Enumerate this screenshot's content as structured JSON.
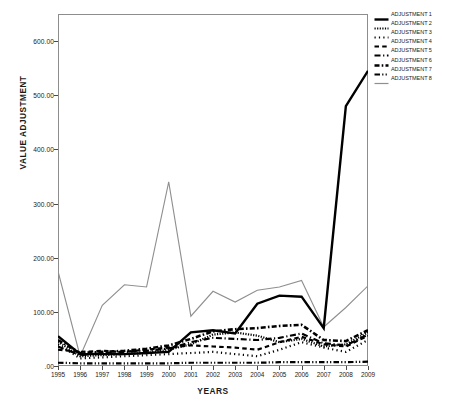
{
  "chart_data": {
    "type": "line",
    "title": "",
    "xlabel": "YEARS",
    "ylabel": "VALUE ADJUSTMENT",
    "x": [
      1995,
      1996,
      1997,
      1998,
      1999,
      2000,
      2001,
      2002,
      2003,
      2004,
      2005,
      2006,
      2007,
      2008,
      2009
    ],
    "categories": [
      "1995",
      "1996",
      "1997",
      "1998",
      "1999",
      "2000",
      "2001",
      "2002",
      "2003",
      "2004",
      "2005",
      "2006",
      "2007",
      "2008",
      "2009"
    ],
    "ylim": [
      0,
      650
    ],
    "xlim": [
      1995,
      2009
    ],
    "yticks": [
      0,
      100,
      200,
      300,
      400,
      500,
      600
    ],
    "ytick_labels": [
      ".00",
      "100.00",
      "200.00",
      "300.00",
      "400.00",
      "500.00",
      "600.00"
    ],
    "grid": false,
    "legend_position": "right",
    "series": [
      {
        "name": "ADJUSTMENT 1",
        "style": "solid-bold",
        "color": "#000000",
        "values": [
          55,
          22,
          22,
          22,
          24,
          26,
          62,
          66,
          60,
          115,
          130,
          128,
          70,
          480,
          545
        ]
      },
      {
        "name": "ADJUSTMENT 2",
        "style": "dotted-fine",
        "color": "#000000",
        "values": [
          45,
          18,
          20,
          22,
          24,
          30,
          40,
          58,
          62,
          56,
          44,
          50,
          36,
          40,
          62
        ]
      },
      {
        "name": "ADJUSTMENT 3",
        "style": "dotted-spaced",
        "color": "#000000",
        "values": [
          40,
          14,
          16,
          18,
          20,
          22,
          24,
          26,
          22,
          18,
          30,
          44,
          34,
          26,
          48
        ]
      },
      {
        "name": "ADJUSTMENT 4",
        "style": "dashed-square",
        "color": "#000000",
        "values": [
          30,
          26,
          28,
          26,
          30,
          34,
          38,
          36,
          34,
          30,
          44,
          54,
          40,
          36,
          56
        ]
      },
      {
        "name": "ADJUSTMENT 5",
        "style": "dash-dot-long",
        "color": "#000000",
        "values": [
          36,
          20,
          24,
          26,
          28,
          32,
          44,
          52,
          50,
          48,
          52,
          60,
          42,
          38,
          58
        ]
      },
      {
        "name": "ADJUSTMENT 6",
        "style": "dash-dot-heavy",
        "color": "#000000",
        "values": [
          48,
          24,
          26,
          28,
          32,
          38,
          50,
          64,
          68,
          70,
          74,
          76,
          48,
          46,
          66
        ]
      },
      {
        "name": "ADJUSTMENT 7",
        "style": "dash-dot-dot",
        "color": "#000000",
        "values": [
          6,
          5,
          5,
          5,
          5,
          5,
          6,
          6,
          6,
          6,
          7,
          7,
          7,
          7,
          8
        ]
      },
      {
        "name": "ADJUSTMENT 8",
        "style": "solid-thin-gray",
        "color": "#8f8f8f",
        "values": [
          175,
          18,
          112,
          150,
          146,
          340,
          92,
          138,
          118,
          140,
          146,
          158,
          72,
          108,
          148
        ]
      }
    ]
  },
  "axes": {
    "y_title": "VALUE ADJUSTMENT",
    "x_title": "YEARS"
  },
  "legend": {
    "items": [
      {
        "label": "ADJUSTMENT 1"
      },
      {
        "label": "ADJUSTMENT 2"
      },
      {
        "label": "ADJUSTMENT 3"
      },
      {
        "label": "ADJUSTMENT 4"
      },
      {
        "label": "ADJUSTMENT 5"
      },
      {
        "label": "ADJUSTMENT 6"
      },
      {
        "label": "ADJUSTMENT 7"
      },
      {
        "label": "ADJUSTMENT 8"
      }
    ]
  }
}
